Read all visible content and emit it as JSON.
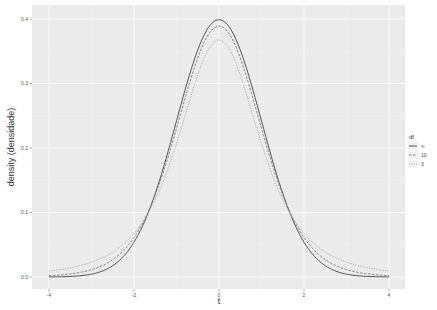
{
  "chart_data": {
    "type": "line",
    "title": "",
    "xlabel": "t",
    "ylabel": "density (densidade)",
    "xlim": [
      -4.2,
      4.2
    ],
    "ylim": [
      -0.018,
      0.418
    ],
    "x_ticks": [
      -4,
      -2,
      0,
      2,
      4
    ],
    "x_tick_labels": [
      "-4",
      "-2",
      "0",
      "2",
      "4"
    ],
    "y_ticks": [
      0.0,
      0.1,
      0.2,
      0.3,
      0.4
    ],
    "y_tick_labels": [
      "0.0",
      "0.1",
      "0.2",
      "0.3",
      "0.4"
    ],
    "grid": true,
    "legend": {
      "title": "df",
      "position": "right",
      "entries": [
        {
          "label": "∞",
          "linetype": "solid",
          "color": "#444444"
        },
        {
          "label": "10",
          "linetype": "dashed",
          "color": "#777777"
        },
        {
          "label": "3",
          "linetype": "dotted",
          "color": "#aaaaaa"
        }
      ]
    },
    "x": [
      -4,
      -3.5,
      -3,
      -2.5,
      -2,
      -1.5,
      -1,
      -0.5,
      0,
      0.5,
      1,
      1.5,
      2,
      2.5,
      3,
      3.5,
      4
    ],
    "series": [
      {
        "name": "∞",
        "df": "inf",
        "values": [
          0.0001,
          0.0009,
          0.0044,
          0.0175,
          0.054,
          0.1295,
          0.242,
          0.3521,
          0.3989,
          0.3521,
          0.242,
          0.1295,
          0.054,
          0.0175,
          0.0044,
          0.0009,
          0.0001
        ]
      },
      {
        "name": "10",
        "df": 10,
        "values": [
          0.002,
          0.0043,
          0.0114,
          0.0269,
          0.0611,
          0.1274,
          0.2304,
          0.3402,
          0.3891,
          0.3402,
          0.2304,
          0.1274,
          0.0611,
          0.0269,
          0.0114,
          0.0043,
          0.002
        ]
      },
      {
        "name": "3",
        "df": 3,
        "values": [
          0.0092,
          0.014,
          0.023,
          0.0382,
          0.0675,
          0.1196,
          0.2067,
          0.3125,
          0.3676,
          0.3125,
          0.2067,
          0.1196,
          0.0675,
          0.0382,
          0.023,
          0.014,
          0.0092
        ]
      }
    ]
  },
  "colors": {
    "panel_bg": "#ebebeb",
    "grid_major": "#ffffff",
    "grid_minor": "#f5f5f5",
    "line_inf": "#444444",
    "line_10": "#777777",
    "line_3": "#aaaaaa"
  }
}
